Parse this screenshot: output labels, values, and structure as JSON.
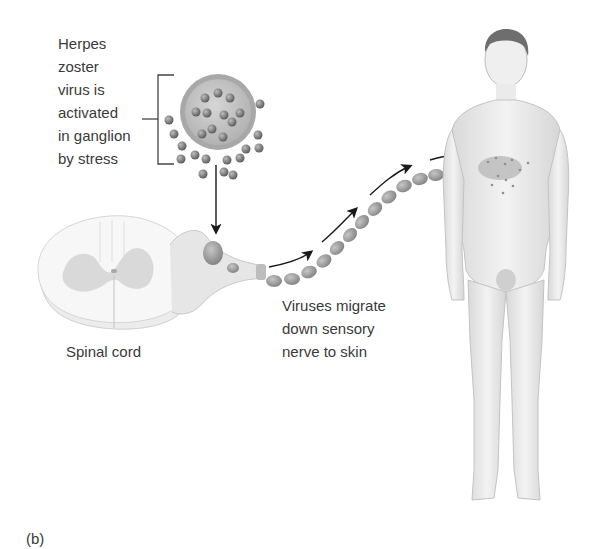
{
  "figure": {
    "panel_label": "(b)",
    "labels": {
      "virus_activation": [
        "Herpes",
        "zoster",
        "virus is",
        "activated",
        "in ganglion",
        "by stress"
      ],
      "spinal_cord": "Spinal cord",
      "migration": [
        "Viruses migrate",
        "down sensory",
        "nerve to skin"
      ]
    },
    "elements": {
      "virus_particle": "herpes-zoster-virion",
      "spinal_cord": "spinal-cord-cross-section",
      "ganglion": "dorsal-root-ganglion",
      "nerve": "sensory-nerve",
      "body": "human-figure-with-shingles-rash"
    },
    "colors": {
      "text": "#3a3a3a",
      "arrow": "#1a1a1a",
      "virion_outer": "#a9a9a9",
      "virion_inner": "#c8c8c8",
      "particle": "#7a7a7a",
      "nerve": "#9c9c9c",
      "skin": "#ececec",
      "rash": "#9a9a9a"
    }
  }
}
